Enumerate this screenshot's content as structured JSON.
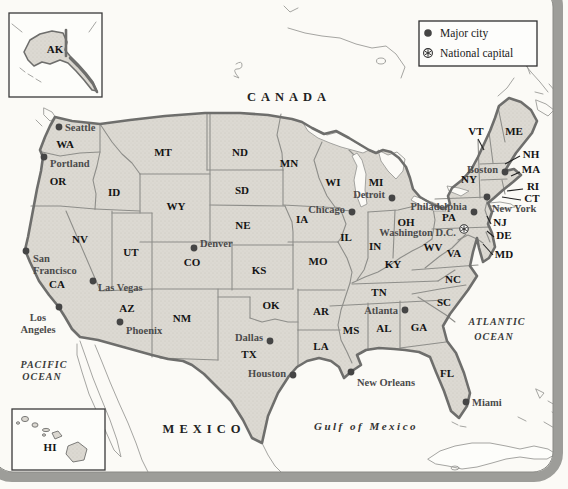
{
  "map_title": "United States reference map",
  "colors": {
    "land": "#dcd9d2",
    "land_dot_texture": "#c9c6be",
    "ocean": "#fbfaf6",
    "national_border": "#6e6e6c",
    "state_border": "#8e8e8a",
    "frame": "#9d9d99",
    "city_dot": "#454545",
    "text": "#141414",
    "city_text": "#4b4b4b"
  },
  "legend": {
    "items": [
      {
        "symbol": "major-city-dot",
        "label": "Major city"
      },
      {
        "symbol": "national-capital-star",
        "label": "National capital"
      }
    ]
  },
  "geo": {
    "canada": "CANADA",
    "mexico": "MEXICO",
    "pacific": [
      "PACIFIC",
      "OCEAN"
    ],
    "atlantic": [
      "ATLANTIC",
      "OCEAN"
    ],
    "gulf": "Gulf of Mexico"
  },
  "insets": {
    "alaska": {
      "label": "AK",
      "x": 55,
      "y": 53
    },
    "hawaii": {
      "label": "HI",
      "x": 50,
      "y": 451
    }
  },
  "states": [
    {
      "abbr": "WA",
      "x": 65,
      "y": 148
    },
    {
      "abbr": "OR",
      "x": 58,
      "y": 185
    },
    {
      "abbr": "CA",
      "x": 57,
      "y": 288
    },
    {
      "abbr": "NV",
      "x": 80,
      "y": 243
    },
    {
      "abbr": "ID",
      "x": 114,
      "y": 196
    },
    {
      "abbr": "MT",
      "x": 163,
      "y": 156
    },
    {
      "abbr": "WY",
      "x": 176,
      "y": 210
    },
    {
      "abbr": "UT",
      "x": 131,
      "y": 256
    },
    {
      "abbr": "AZ",
      "x": 127,
      "y": 312
    },
    {
      "abbr": "NM",
      "x": 182,
      "y": 322
    },
    {
      "abbr": "CO",
      "x": 192,
      "y": 266
    },
    {
      "abbr": "ND",
      "x": 240,
      "y": 156
    },
    {
      "abbr": "SD",
      "x": 242,
      "y": 194
    },
    {
      "abbr": "NE",
      "x": 243,
      "y": 229
    },
    {
      "abbr": "KS",
      "x": 259,
      "y": 274
    },
    {
      "abbr": "OK",
      "x": 271,
      "y": 309
    },
    {
      "abbr": "TX",
      "x": 249,
      "y": 358
    },
    {
      "abbr": "MN",
      "x": 289,
      "y": 167
    },
    {
      "abbr": "IA",
      "x": 302,
      "y": 223
    },
    {
      "abbr": "MO",
      "x": 318,
      "y": 265
    },
    {
      "abbr": "AR",
      "x": 321,
      "y": 315
    },
    {
      "abbr": "LA",
      "x": 321,
      "y": 350
    },
    {
      "abbr": "WI",
      "x": 333,
      "y": 186
    },
    {
      "abbr": "IL",
      "x": 346,
      "y": 241
    },
    {
      "abbr": "MI",
      "x": 376,
      "y": 186
    },
    {
      "abbr": "IN",
      "x": 375,
      "y": 250
    },
    {
      "abbr": "OH",
      "x": 406,
      "y": 226
    },
    {
      "abbr": "KY",
      "x": 393,
      "y": 268
    },
    {
      "abbr": "TN",
      "x": 379,
      "y": 296
    },
    {
      "abbr": "MS",
      "x": 351,
      "y": 334
    },
    {
      "abbr": "AL",
      "x": 384,
      "y": 332
    },
    {
      "abbr": "GA",
      "x": 419,
      "y": 331
    },
    {
      "abbr": "FL",
      "x": 447,
      "y": 377
    },
    {
      "abbr": "SC",
      "x": 444,
      "y": 306
    },
    {
      "abbr": "NC",
      "x": 453,
      "y": 283
    },
    {
      "abbr": "VA",
      "x": 454,
      "y": 257
    },
    {
      "abbr": "WV",
      "x": 433,
      "y": 251
    },
    {
      "abbr": "PA",
      "x": 449,
      "y": 221
    },
    {
      "abbr": "NY",
      "x": 469,
      "y": 183
    },
    {
      "abbr": "ME",
      "x": 514,
      "y": 135
    },
    {
      "abbr": "VT",
      "x": 476,
      "y": 135,
      "leader": [
        478,
        139,
        484,
        150
      ]
    },
    {
      "abbr": "NH",
      "x": 531,
      "y": 158,
      "leader": [
        520,
        156,
        505,
        164
      ]
    },
    {
      "abbr": "MA",
      "x": 531,
      "y": 173,
      "leader": [
        520,
        172,
        511,
        176
      ]
    },
    {
      "abbr": "RI",
      "x": 533,
      "y": 190,
      "leader": [
        523,
        189,
        507,
        191
      ]
    },
    {
      "abbr": "CT",
      "x": 532,
      "y": 202,
      "leader": [
        521,
        200,
        502,
        197
      ]
    },
    {
      "abbr": "NJ",
      "x": 500,
      "y": 226,
      "leader": [
        491,
        224,
        487,
        216
      ]
    },
    {
      "abbr": "DE",
      "x": 504,
      "y": 239,
      "leader": [
        494,
        237,
        487,
        231
      ]
    },
    {
      "abbr": "MD",
      "x": 504,
      "y": 258,
      "leader": [
        493,
        255,
        483,
        244
      ]
    }
  ],
  "cities": [
    {
      "id": "seattle",
      "name": "Seattle",
      "dot": [
        59,
        127
      ],
      "lines": [
        "Seattle"
      ],
      "label": [
        65,
        131
      ],
      "anchor": "start"
    },
    {
      "id": "portland",
      "name": "Portland",
      "dot": [
        44,
        157
      ],
      "lines": [
        "Portland"
      ],
      "label": [
        50,
        167
      ],
      "anchor": "start"
    },
    {
      "id": "san-francisco",
      "name": "San Francisco",
      "dot": [
        26,
        251
      ],
      "lines": [
        "San",
        "Francisco"
      ],
      "label": [
        33,
        262
      ],
      "anchor": "start"
    },
    {
      "id": "los-angeles",
      "name": "Los Angeles",
      "dot": [
        59,
        307
      ],
      "lines": [
        "Los",
        "Angeles"
      ],
      "label": [
        38,
        321
      ],
      "anchor": "middle"
    },
    {
      "id": "las-vegas",
      "name": "Las Vegas",
      "dot": [
        93,
        281
      ],
      "lines": [
        "Las Vegas"
      ],
      "label": [
        98,
        291
      ],
      "anchor": "start"
    },
    {
      "id": "phoenix",
      "name": "Phoenix",
      "dot": [
        120,
        322
      ],
      "lines": [
        "Phoenix"
      ],
      "label": [
        126,
        334
      ],
      "anchor": "start"
    },
    {
      "id": "denver",
      "name": "Denver",
      "dot": [
        194,
        248
      ],
      "lines": [
        "Denver"
      ],
      "label": [
        200,
        247
      ],
      "anchor": "start"
    },
    {
      "id": "dallas",
      "name": "Dallas",
      "dot": [
        270,
        341
      ],
      "lines": [
        "Dallas"
      ],
      "label": [
        263,
        341
      ],
      "anchor": "end"
    },
    {
      "id": "houston",
      "name": "Houston",
      "dot": [
        293,
        375
      ],
      "lines": [
        "Houston"
      ],
      "label": [
        286,
        377
      ],
      "anchor": "end"
    },
    {
      "id": "new-orleans",
      "name": "New Orleans",
      "dot": [
        351,
        372
      ],
      "lines": [
        "New Orleans"
      ],
      "label": [
        357,
        386
      ],
      "anchor": "start"
    },
    {
      "id": "miami",
      "name": "Miami",
      "dot": [
        466,
        402
      ],
      "lines": [
        "Miami"
      ],
      "label": [
        472,
        406
      ],
      "anchor": "start"
    },
    {
      "id": "atlanta",
      "name": "Atlanta",
      "dot": [
        405,
        310
      ],
      "lines": [
        "Atlanta"
      ],
      "label": [
        398,
        314
      ],
      "anchor": "end"
    },
    {
      "id": "chicago",
      "name": "Chicago",
      "dot": [
        352,
        212
      ],
      "lines": [
        "Chicago"
      ],
      "label": [
        345,
        213
      ],
      "anchor": "end"
    },
    {
      "id": "detroit",
      "name": "Detroit",
      "dot": [
        392,
        198
      ],
      "lines": [
        "Detroit"
      ],
      "label": [
        385,
        198
      ],
      "anchor": "end"
    },
    {
      "id": "philadelphia",
      "name": "Philadelphia",
      "dot": [
        474,
        212
      ],
      "lines": [
        "Philadelphia"
      ],
      "label": [
        467,
        210
      ],
      "anchor": "end"
    },
    {
      "id": "new-york",
      "name": "New York",
      "dot": [
        487,
        197
      ],
      "lines": [
        "New York"
      ],
      "label": [
        492,
        212
      ],
      "anchor": "start"
    },
    {
      "id": "boston",
      "name": "Boston",
      "dot": [
        505,
        172
      ],
      "lines": [
        "Boston"
      ],
      "label": [
        498,
        173
      ],
      "anchor": "end"
    }
  ],
  "capital": {
    "name": "Washington D.C.",
    "star": [
      464,
      229
    ],
    "label": [
      456,
      236
    ],
    "anchor": "end"
  }
}
